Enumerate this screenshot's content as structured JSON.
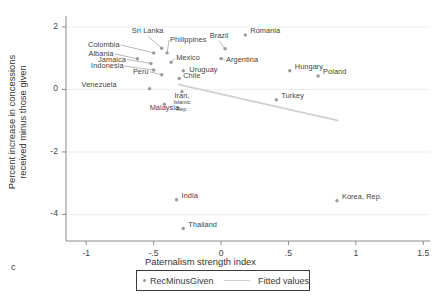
{
  "panel_letter": "c",
  "axes": {
    "x_title": "Paternalism strength index",
    "y_title_line1": "Percent increase in concessions",
    "y_title_line2": "received minus those given",
    "x_ticks": [
      "-1",
      "-.5",
      "0",
      ".5",
      "1",
      "1.5"
    ],
    "y_ticks": [
      "2",
      "0",
      "-2",
      "-4"
    ]
  },
  "legend": {
    "series_label": "RecMinusGiven",
    "fit_label": "Fitted values"
  },
  "colors": {
    "marker": "#9a9a9a",
    "fit_line": "#d0d0d0",
    "axis": "#8a8a8a",
    "grid": "#ededed",
    "text": "#3f3f3f"
  },
  "chart_data": {
    "type": "scatter",
    "title": "",
    "xlabel": "Paternalism strength index",
    "ylabel": "Percent increase in concessions received minus those given",
    "xlim": [
      -1.15,
      1.55
    ],
    "ylim": [
      -4.85,
      2.35
    ],
    "grid": true,
    "legend_position": "bottom",
    "series": [
      {
        "name": "RecMinusGiven",
        "points": [
          {
            "label": "Sri Lanka",
            "x": -0.44,
            "y": 1.32
          },
          {
            "label": "Colombia",
            "x": -0.5,
            "y": 1.17
          },
          {
            "label": "Philippines",
            "x": -0.4,
            "y": 1.17
          },
          {
            "label": "Brazil",
            "x": 0.03,
            "y": 1.3
          },
          {
            "label": "Albania",
            "x": -0.62,
            "y": 0.98
          },
          {
            "label": "Argentina",
            "x": 0.0,
            "y": 0.99
          },
          {
            "label": "Mexico",
            "x": -0.37,
            "y": 0.87
          },
          {
            "label": "Jamaica",
            "x": -0.52,
            "y": 0.83
          },
          {
            "label": "Indonesia",
            "x": -0.5,
            "y": 0.62
          },
          {
            "label": "Uruguay",
            "x": -0.28,
            "y": 0.6
          },
          {
            "label": "Peru",
            "x": -0.44,
            "y": 0.47
          },
          {
            "label": "Chile",
            "x": -0.31,
            "y": 0.35
          },
          {
            "label": "Venezuela",
            "x": -0.53,
            "y": 0.02
          },
          {
            "label": "Iran, Islamic Rep.",
            "x": -0.29,
            "y": -0.07
          },
          {
            "label": "Malaysia",
            "x": -0.42,
            "y": -0.47
          },
          {
            "label": "Romania",
            "x": 0.18,
            "y": 1.74
          },
          {
            "label": "Hungary",
            "x": 0.51,
            "y": 0.6
          },
          {
            "label": "Poland",
            "x": 0.72,
            "y": 0.43
          },
          {
            "label": "Turkey",
            "x": 0.41,
            "y": -0.33
          },
          {
            "label": "India",
            "x": -0.33,
            "y": -3.53
          },
          {
            "label": "Korea, Rep.",
            "x": 0.86,
            "y": -3.56
          },
          {
            "label": "Thailand",
            "x": -0.28,
            "y": -4.45
          }
        ]
      }
    ],
    "fit_line": {
      "name": "Fitted values",
      "x_start": -0.32,
      "y_start": 0.16,
      "x_end": 0.87,
      "y_end": -1.0
    }
  }
}
